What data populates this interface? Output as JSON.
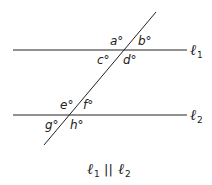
{
  "diagram": {
    "lines": {
      "l1": {
        "symbol": "ℓ",
        "subscript": "1"
      },
      "l2": {
        "symbol": "ℓ",
        "subscript": "2"
      }
    },
    "angles": {
      "a": "a°",
      "b": "b°",
      "c": "c°",
      "d": "d°",
      "e": "e°",
      "f": "f°",
      "g": "g°",
      "h": "h°"
    },
    "caption": {
      "left_symbol": "ℓ",
      "left_sub": "1",
      "parallel": "||",
      "right_symbol": "ℓ",
      "right_sub": "2"
    },
    "colors": {
      "stroke": "#222222",
      "background": "#ffffff"
    }
  }
}
